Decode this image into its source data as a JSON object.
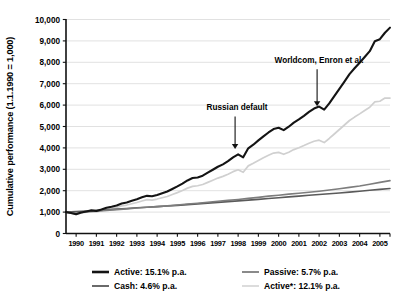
{
  "chart_data": {
    "type": "line",
    "title": "",
    "xlabel": "",
    "ylabel": "Cumulative performance (1.1.1990 = 1,000)",
    "xlim": [
      1990,
      2006
    ],
    "ylim": [
      0,
      10000
    ],
    "grid": true,
    "legend_position": "bottom",
    "yticks": [
      "0",
      "1,000",
      "2,000",
      "3,000",
      "4,000",
      "5,000",
      "6,000",
      "7,000",
      "8,000",
      "9,000",
      "10,000"
    ],
    "ytick_values": [
      0,
      1000,
      2000,
      3000,
      4000,
      5000,
      6000,
      7000,
      8000,
      9000,
      10000
    ],
    "xticks": [
      "1990",
      "1991",
      "1992",
      "1993",
      "1994",
      "1995",
      "1996",
      "1997",
      "1998",
      "1999",
      "2000",
      "2001",
      "2002",
      "2003",
      "2004",
      "2005"
    ],
    "xtick_values": [
      1990,
      1991,
      1992,
      1993,
      1994,
      1995,
      1996,
      1997,
      1998,
      1999,
      2000,
      2001,
      2002,
      2003,
      2004,
      2005
    ],
    "annotations": [
      {
        "text": "Russian default",
        "x": 1998.35,
        "y_text": 5750,
        "y_point": 3950
      },
      {
        "text": "Worldcom, Enron et al.",
        "x": 2002.4,
        "y_text": 7950,
        "y_point": 5950
      }
    ],
    "series": [
      {
        "name": "Active",
        "legend_label": "Active: 15.1% p.a.",
        "cagr_percent": 15.1,
        "color": "#141414",
        "width": 2.1,
        "x": [
          1990.0,
          1990.25,
          1990.5,
          1990.75,
          1991.0,
          1991.25,
          1991.5,
          1991.75,
          1992.0,
          1992.25,
          1992.5,
          1992.75,
          1993.0,
          1993.25,
          1993.5,
          1993.75,
          1994.0,
          1994.25,
          1994.5,
          1994.75,
          1995.0,
          1995.25,
          1995.5,
          1995.75,
          1996.0,
          1996.25,
          1996.5,
          1996.75,
          1997.0,
          1997.25,
          1997.5,
          1997.75,
          1998.0,
          1998.25,
          1998.5,
          1998.75,
          1999.0,
          1999.25,
          1999.5,
          1999.75,
          2000.0,
          2000.25,
          2000.5,
          2000.75,
          2001.0,
          2001.25,
          2001.5,
          2001.75,
          2002.0,
          2002.25,
          2002.5,
          2002.75,
          2003.0,
          2003.25,
          2003.5,
          2003.75,
          2004.0,
          2004.25,
          2004.5,
          2004.75,
          2005.0,
          2005.25,
          2005.5,
          2005.75,
          2006.0
        ],
        "values": [
          1000,
          960,
          900,
          980,
          1030,
          1080,
          1050,
          1120,
          1200,
          1250,
          1310,
          1400,
          1450,
          1530,
          1600,
          1690,
          1760,
          1740,
          1800,
          1880,
          1960,
          2080,
          2200,
          2330,
          2480,
          2590,
          2620,
          2700,
          2840,
          2980,
          3120,
          3230,
          3380,
          3560,
          3700,
          3560,
          3980,
          4150,
          4350,
          4540,
          4720,
          4880,
          4940,
          4830,
          4990,
          5180,
          5330,
          5500,
          5680,
          5840,
          5930,
          5790,
          6080,
          6420,
          6760,
          7100,
          7450,
          7720,
          7980,
          8250,
          8520,
          8980,
          9080,
          9380,
          9620
        ]
      },
      {
        "name": "Active*",
        "legend_label": "Active*: 12.1% p.a.",
        "cagr_percent": 12.1,
        "color": "#d0d0d0",
        "width": 1.7,
        "x": [
          1990.0,
          1990.25,
          1990.5,
          1990.75,
          1991.0,
          1991.25,
          1991.5,
          1991.75,
          1992.0,
          1992.25,
          1992.5,
          1992.75,
          1993.0,
          1993.25,
          1993.5,
          1993.75,
          1994.0,
          1994.25,
          1994.5,
          1994.75,
          1995.0,
          1995.25,
          1995.5,
          1995.75,
          1996.0,
          1996.25,
          1996.5,
          1996.75,
          1997.0,
          1997.25,
          1997.5,
          1997.75,
          1998.0,
          1998.25,
          1998.5,
          1998.75,
          1999.0,
          1999.25,
          1999.5,
          1999.75,
          2000.0,
          2000.25,
          2000.5,
          2000.75,
          2001.0,
          2001.25,
          2001.5,
          2001.75,
          2002.0,
          2002.25,
          2002.5,
          2002.75,
          2003.0,
          2003.25,
          2003.5,
          2003.75,
          2004.0,
          2004.25,
          2004.5,
          2004.75,
          2005.0,
          2005.25,
          2005.5,
          2005.75,
          2006.0
        ],
        "values": [
          1000,
          950,
          890,
          960,
          1000,
          1040,
          1010,
          1070,
          1130,
          1170,
          1220,
          1290,
          1330,
          1390,
          1450,
          1520,
          1580,
          1560,
          1610,
          1670,
          1730,
          1820,
          1910,
          2010,
          2120,
          2200,
          2230,
          2290,
          2390,
          2490,
          2590,
          2670,
          2770,
          2890,
          2980,
          2860,
          3160,
          3280,
          3410,
          3540,
          3660,
          3760,
          3790,
          3700,
          3800,
          3920,
          4010,
          4110,
          4220,
          4310,
          4360,
          4250,
          4440,
          4650,
          4860,
          5070,
          5280,
          5440,
          5590,
          5750,
          5900,
          6150,
          6180,
          6330,
          6330
        ]
      },
      {
        "name": "Passive",
        "legend_label": "Passive: 5.7% p.a.",
        "cagr_percent": 5.7,
        "color": "#7d7d7d",
        "width": 1.6,
        "x": [
          1990.0,
          1990.25,
          1990.5,
          1990.75,
          1991.0,
          1991.5,
          1992.0,
          1992.5,
          1993.0,
          1993.5,
          1994.0,
          1994.5,
          1995.0,
          1995.5,
          1996.0,
          1996.5,
          1997.0,
          1997.5,
          1998.0,
          1998.5,
          1999.0,
          1999.5,
          2000.0,
          2000.5,
          2001.0,
          2001.5,
          2002.0,
          2002.5,
          2003.0,
          2003.5,
          2004.0,
          2004.5,
          2005.0,
          2005.5,
          2006.0
        ],
        "values": [
          1000,
          975,
          950,
          985,
          1010,
          1045,
          1080,
          1115,
          1150,
          1190,
          1225,
          1255,
          1290,
          1330,
          1375,
          1415,
          1460,
          1505,
          1550,
          1590,
          1640,
          1690,
          1745,
          1790,
          1840,
          1880,
          1930,
          1975,
          2030,
          2090,
          2155,
          2220,
          2300,
          2390,
          2470
        ]
      },
      {
        "name": "Cash",
        "legend_label": "Cash: 4.6% p.a.",
        "cagr_percent": 4.6,
        "color": "#5a5a5a",
        "width": 1.6,
        "x": [
          1990.0,
          1990.25,
          1990.5,
          1990.75,
          1991.0,
          1991.5,
          1992.0,
          1992.5,
          1993.0,
          1993.5,
          1994.0,
          1994.5,
          1995.0,
          1995.5,
          1996.0,
          1996.5,
          1997.0,
          1997.5,
          1998.0,
          1998.5,
          1999.0,
          1999.5,
          2000.0,
          2000.5,
          2001.0,
          2001.5,
          2002.0,
          2002.5,
          2003.0,
          2003.5,
          2004.0,
          2004.5,
          2005.0,
          2005.5,
          2006.0
        ],
        "values": [
          1000,
          1010,
          1020,
          1035,
          1050,
          1080,
          1110,
          1140,
          1170,
          1200,
          1230,
          1255,
          1285,
          1315,
          1350,
          1385,
          1420,
          1455,
          1490,
          1525,
          1560,
          1595,
          1635,
          1670,
          1710,
          1745,
          1785,
          1820,
          1860,
          1895,
          1935,
          1975,
          2020,
          2060,
          2105
        ]
      }
    ],
    "legend": [
      {
        "label": "Active: 15.1% p.a.",
        "color": "#141414",
        "width": 2.6,
        "column": "left",
        "row": 0
      },
      {
        "label": "Cash: 4.6% p.a.",
        "color": "#5a5a5a",
        "width": 1.8,
        "column": "left",
        "row": 1
      },
      {
        "label": "Passive: 5.7% p.a.",
        "color": "#7d7d7d",
        "width": 1.8,
        "column": "right",
        "row": 0
      },
      {
        "label": "Active*: 12.1% p.a.",
        "color": "#d8d8d8",
        "width": 1.8,
        "column": "right",
        "row": 1
      }
    ]
  }
}
